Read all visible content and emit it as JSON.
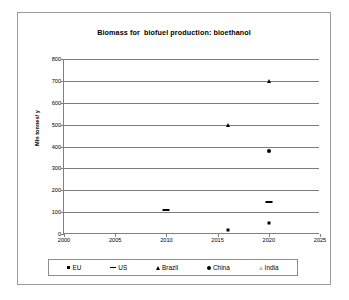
{
  "chart_data": {
    "type": "scatter",
    "title": "Biomass for  biofuel production: bioethanol",
    "xlabel": "",
    "ylabel": "Mln tonnes/ y",
    "xlim": [
      2000,
      2025
    ],
    "ylim": [
      0,
      800
    ],
    "x_ticks": [
      2000,
      2005,
      2010,
      2015,
      2020,
      2025
    ],
    "y_ticks": [
      0,
      100,
      200,
      300,
      400,
      500,
      600,
      700,
      800
    ],
    "grid": "horizontal",
    "legend_position": "bottom",
    "series": [
      {
        "name": "EU",
        "marker": "square",
        "color": "#000000",
        "points": [
          {
            "x": 2016,
            "y": 20
          },
          {
            "x": 2020,
            "y": 50
          }
        ]
      },
      {
        "name": "US",
        "marker": "dash",
        "color": "#000000",
        "points": [
          {
            "x": 2010,
            "y": 110
          },
          {
            "x": 2020,
            "y": 145
          }
        ]
      },
      {
        "name": "Brazil",
        "marker": "triangle",
        "color": "#000000",
        "points": [
          {
            "x": 2016,
            "y": 500
          },
          {
            "x": 2020,
            "y": 700
          }
        ]
      },
      {
        "name": "China",
        "marker": "circle",
        "color": "#000000",
        "points": [
          {
            "x": 2020,
            "y": 380
          }
        ]
      },
      {
        "name": "India",
        "marker": "triangle-light",
        "color": "#c2c2c2",
        "points": []
      }
    ]
  },
  "legend": {
    "items": [
      {
        "label": "EU",
        "marker": "square"
      },
      {
        "label": "US",
        "marker": "dash"
      },
      {
        "label": "Brazil",
        "marker": "triangle"
      },
      {
        "label": "China",
        "marker": "circle"
      },
      {
        "label": "India",
        "marker": "triangle-light"
      }
    ]
  }
}
